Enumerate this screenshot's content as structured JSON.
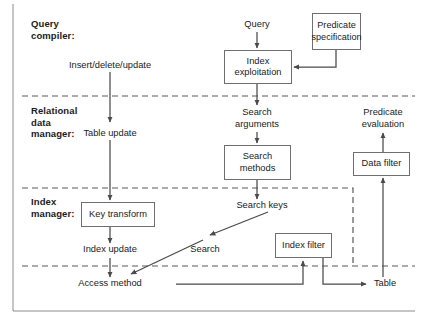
{
  "figure": {
    "stroke_color": "#6f6f6f",
    "text_color": "#1b1b1b",
    "background": "#ffffff"
  },
  "layers": [
    {
      "id": "query-compiler",
      "label": "Query\ncompiler:"
    },
    {
      "id": "relational-data-manager",
      "label": "Relational\ndata\nmanager:"
    },
    {
      "id": "index-manager",
      "label": "Index\nmanager:"
    }
  ],
  "boxes": [
    {
      "id": "index-exploitation",
      "label": "Index\nexploitation"
    },
    {
      "id": "predicate-specification",
      "label": "Predicate\nspecification"
    },
    {
      "id": "search-methods",
      "label": "Search\nmethods"
    },
    {
      "id": "data-filter",
      "label": "Data filter"
    },
    {
      "id": "key-transform",
      "label": "Key transform"
    },
    {
      "id": "index-filter",
      "label": "Index filter"
    }
  ],
  "flow_labels": [
    {
      "id": "query",
      "label": "Query"
    },
    {
      "id": "insert-delete-update",
      "label": "Insert/delete/update"
    },
    {
      "id": "search-arguments",
      "label": "Search\narguments"
    },
    {
      "id": "predicate-evaluation",
      "label": "Predicate\nevaluation"
    },
    {
      "id": "table-update",
      "label": "Table update"
    },
    {
      "id": "search-keys",
      "label": "Search keys"
    },
    {
      "id": "index-update",
      "label": "Index update"
    },
    {
      "id": "search",
      "label": "Search"
    },
    {
      "id": "access-method",
      "label": "Access method"
    },
    {
      "id": "table",
      "label": "Table"
    }
  ]
}
